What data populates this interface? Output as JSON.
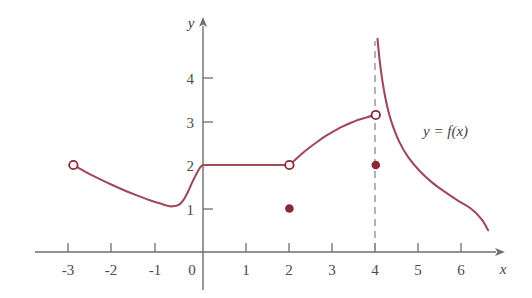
{
  "figure": {
    "background_color": "#ffffff",
    "curve_color": "#a0495a",
    "point_color": "#8b2838",
    "axis_color": "#6e6e6e",
    "text_color": "#3f3f3f",
    "dash_color": "#8c8c8c"
  },
  "chart_data": {
    "type": "line",
    "title": "",
    "xlabel": "x",
    "ylabel": "y",
    "xlim": [
      -3.85,
      6.85
    ],
    "ylim": [
      -0.35,
      5.3
    ],
    "grid": false,
    "legend": "none",
    "annotations": [
      {
        "text": "y = f(x)",
        "x": 5.05,
        "y": 3.0
      }
    ],
    "xticks": [
      -3,
      -2,
      -1,
      0,
      1,
      2,
      3,
      4,
      5,
      6
    ],
    "xticklabels": [
      "-3",
      "-2",
      "-1",
      "0",
      "1",
      "2",
      "3",
      "4",
      "5",
      "6"
    ],
    "yticks": [
      1,
      2,
      3,
      4
    ],
    "yticklabels": [
      "1",
      "2",
      "3",
      "4"
    ],
    "asymptotes": [
      {
        "type": "vertical",
        "x": 4,
        "style": "dashed",
        "y_from": -0.05,
        "y_to": 4.85
      }
    ],
    "series": [
      {
        "name": "branch-left-descending",
        "comment": "open endpoint at (-3,2), dips to local min near (-0.7,1.05), rises to (0,2)",
        "points": [
          [
            -3.0,
            2.0
          ],
          [
            -2.7,
            1.83
          ],
          [
            -2.4,
            1.68
          ],
          [
            -2.1,
            1.54
          ],
          [
            -1.8,
            1.41
          ],
          [
            -1.5,
            1.29
          ],
          [
            -1.2,
            1.18
          ],
          [
            -1.0,
            1.12
          ],
          [
            -0.85,
            1.07
          ],
          [
            -0.7,
            1.05
          ],
          [
            -0.55,
            1.09
          ],
          [
            -0.45,
            1.2
          ],
          [
            -0.35,
            1.38
          ],
          [
            -0.25,
            1.6
          ],
          [
            -0.15,
            1.8
          ],
          [
            -0.07,
            1.94
          ],
          [
            0.0,
            2.0
          ]
        ]
      },
      {
        "name": "branch-constant",
        "comment": "horizontal segment y = 2 from x = 0 to x = 2",
        "points": [
          [
            0.0,
            2.0
          ],
          [
            2.0,
            2.0
          ]
        ]
      },
      {
        "name": "branch-rising-arc",
        "comment": "concave-down arc from (2,2) up to (4,3.15)",
        "points": [
          [
            2.0,
            2.0
          ],
          [
            2.2,
            2.18
          ],
          [
            2.4,
            2.35
          ],
          [
            2.6,
            2.5
          ],
          [
            2.8,
            2.64
          ],
          [
            3.0,
            2.76
          ],
          [
            3.2,
            2.87
          ],
          [
            3.4,
            2.96
          ],
          [
            3.6,
            3.04
          ],
          [
            3.8,
            3.1
          ],
          [
            4.0,
            3.15
          ]
        ]
      },
      {
        "name": "branch-hyperbolic-decay",
        "comment": "right of the asymptote x = 4; falls from top of frame toward the x-axis",
        "points": [
          [
            4.04,
            4.9
          ],
          [
            4.09,
            4.4
          ],
          [
            4.15,
            3.95
          ],
          [
            4.22,
            3.55
          ],
          [
            4.3,
            3.2
          ],
          [
            4.4,
            2.88
          ],
          [
            4.55,
            2.52
          ],
          [
            4.75,
            2.18
          ],
          [
            5.0,
            1.88
          ],
          [
            5.3,
            1.6
          ],
          [
            5.6,
            1.38
          ],
          [
            5.9,
            1.18
          ],
          [
            6.2,
            1.0
          ],
          [
            6.45,
            0.75
          ],
          [
            6.6,
            0.5
          ]
        ]
      }
    ],
    "open_points": [
      {
        "x": -3,
        "y": 2
      },
      {
        "x": 2,
        "y": 2
      },
      {
        "x": 4,
        "y": 3.15
      }
    ],
    "filled_points": [
      {
        "x": 2,
        "y": 1
      },
      {
        "x": 4,
        "y": 2
      }
    ]
  }
}
